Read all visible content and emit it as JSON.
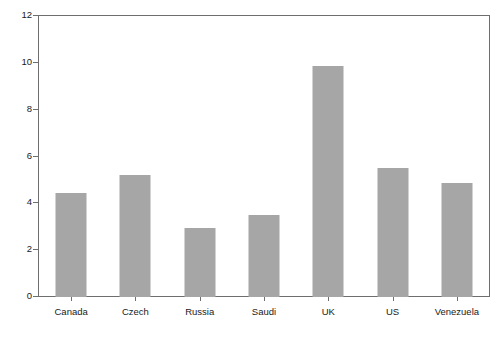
{
  "chart_data": {
    "type": "bar",
    "title": "",
    "subtitle": "",
    "xlabel": "",
    "ylabel": "% of GDP per kg oil equivalent 2007",
    "categories": [
      "Canada",
      "Czech",
      "Russia",
      "Saudi",
      "UK",
      "US",
      "Venezuela"
    ],
    "values": [
      4.45,
      5.2,
      2.95,
      3.5,
      9.85,
      5.5,
      4.85
    ],
    "series": [
      {
        "name": "% of GDP per kg oil equivalent 2007",
        "values": [
          4.45,
          5.2,
          2.95,
          3.5,
          9.85,
          5.5,
          4.85
        ]
      }
    ],
    "ylim": [
      0,
      12
    ],
    "yticks": [
      0,
      2,
      4,
      6,
      8,
      10,
      12
    ],
    "ytick_labels": [
      "0",
      "2",
      "4",
      "6",
      "8",
      "10",
      "12"
    ],
    "grid": false,
    "legend": false,
    "legend_position": "none",
    "bar_color": "#a6a6a6",
    "axis_color": "#6e6e6e",
    "background_color": "#ffffff",
    "annotations": []
  }
}
